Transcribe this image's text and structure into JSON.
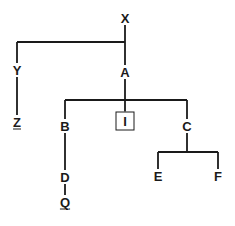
{
  "diagram": {
    "type": "family-tree",
    "background_color": "#ffffff",
    "line_color": "#1a1a1a",
    "text_color": "#1a1a1a",
    "nodes": [
      {
        "id": "X",
        "label": "X",
        "x": 125,
        "y": 18,
        "style": "plain",
        "underlined": false
      },
      {
        "id": "Y",
        "label": "Y",
        "x": 17,
        "y": 70,
        "style": "plain",
        "underlined": false
      },
      {
        "id": "Z",
        "label": "Z",
        "x": 17,
        "y": 122,
        "style": "underlined",
        "underlined": true
      },
      {
        "id": "A",
        "label": "A",
        "x": 125,
        "y": 72,
        "style": "plain",
        "underlined": false
      },
      {
        "id": "B",
        "label": "B",
        "x": 65,
        "y": 126,
        "style": "plain",
        "underlined": false
      },
      {
        "id": "I",
        "label": "I",
        "x": 125,
        "y": 121,
        "style": "boxed",
        "underlined": false
      },
      {
        "id": "C",
        "label": "C",
        "x": 187,
        "y": 126,
        "style": "plain",
        "underlined": false
      },
      {
        "id": "D",
        "label": "D",
        "x": 65,
        "y": 177,
        "style": "plain",
        "underlined": false
      },
      {
        "id": "Q",
        "label": "Q",
        "x": 65,
        "y": 202,
        "style": "underlined",
        "underlined": true
      },
      {
        "id": "E",
        "label": "E",
        "x": 158,
        "y": 176,
        "style": "plain",
        "underlined": false
      },
      {
        "id": "F",
        "label": "F",
        "x": 218,
        "y": 176,
        "style": "plain",
        "underlined": false
      }
    ],
    "edges": [
      {
        "from": "X",
        "to": "Y",
        "kind": "bracket",
        "bar_y": 42
      },
      {
        "from": "X",
        "to": "A",
        "kind": "bracket",
        "bar_y": 42
      },
      {
        "from": "A",
        "to": "B",
        "kind": "bracket",
        "bar_y": 100
      },
      {
        "from": "A",
        "to": "I",
        "kind": "bracket",
        "bar_y": 100
      },
      {
        "from": "A",
        "to": "C",
        "kind": "bracket",
        "bar_y": 100
      },
      {
        "from": "Y",
        "to": "Z",
        "kind": "vertical"
      },
      {
        "from": "B",
        "to": "D",
        "kind": "vertical"
      },
      {
        "from": "D",
        "to": "Q",
        "kind": "vertical"
      },
      {
        "from": "C",
        "to": "E",
        "kind": "bracket",
        "bar_y": 152
      },
      {
        "from": "C",
        "to": "F",
        "kind": "bracket",
        "bar_y": 152
      }
    ]
  }
}
